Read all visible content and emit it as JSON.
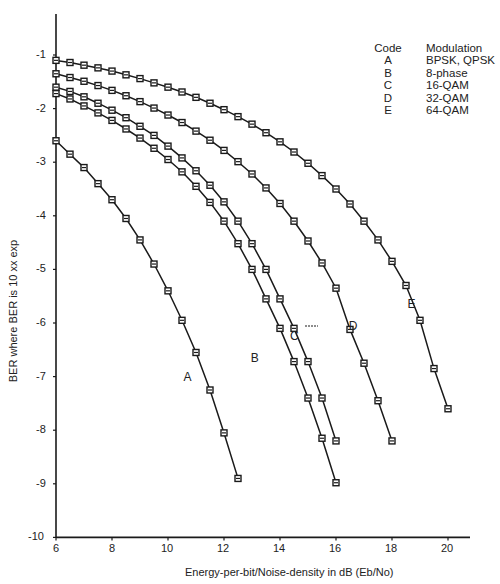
{
  "chart_data": {
    "type": "line",
    "title": "",
    "xlabel": "Energy-per-bit/Noise-density in dB  (Eb/No)",
    "ylabel": "BER where BER is 10 xx exp",
    "xlim": [
      6,
      20.8
    ],
    "ylim": [
      -10,
      -0.4
    ],
    "xticks": [
      6,
      8,
      10,
      12,
      14,
      16,
      18,
      20
    ],
    "yticks": [
      -1,
      -2,
      -3,
      -4,
      -5,
      -6,
      -7,
      -8,
      -9,
      -10
    ],
    "grid": false,
    "legend_position": "top-right",
    "legend": {
      "header": [
        "Code",
        "Modulation"
      ],
      "entries": [
        {
          "code": "A",
          "modulation": "BPSK, QPSK"
        },
        {
          "code": "B",
          "modulation": "8-phase"
        },
        {
          "code": "C",
          "modulation": "16-QAM"
        },
        {
          "code": "D",
          "modulation": "32-QAM"
        },
        {
          "code": "E",
          "modulation": "64-QAM"
        }
      ]
    },
    "series": [
      {
        "name": "A",
        "label": "BPSK, QPSK",
        "x": [
          6,
          6.5,
          7,
          7.5,
          8,
          8.5,
          9,
          9.5,
          10,
          10.5,
          11,
          11.5,
          12,
          12.5
        ],
        "y": [
          -2.6,
          -2.85,
          -3.1,
          -3.4,
          -3.7,
          -4.05,
          -4.45,
          -4.9,
          -5.4,
          -5.95,
          -6.55,
          -7.25,
          -8.05,
          -8.9
        ]
      },
      {
        "name": "B",
        "label": "8-phase",
        "x": [
          6,
          6.5,
          7,
          7.5,
          8,
          8.5,
          9,
          9.5,
          10,
          10.5,
          11,
          11.5,
          12,
          12.5,
          13,
          13.5,
          14,
          14.5,
          15,
          15.5,
          16
        ],
        "y": [
          -1.72,
          -1.82,
          -1.95,
          -2.08,
          -2.22,
          -2.38,
          -2.55,
          -2.74,
          -2.95,
          -3.18,
          -3.45,
          -3.75,
          -4.1,
          -4.52,
          -5.0,
          -5.55,
          -6.1,
          -6.72,
          -7.4,
          -8.15,
          -8.98
        ]
      },
      {
        "name": "C",
        "label": "16-QAM",
        "x": [
          6,
          6.5,
          7,
          7.5,
          8,
          8.5,
          9,
          9.5,
          10,
          10.5,
          11,
          11.5,
          12,
          12.5,
          13,
          13.5,
          14,
          14.5,
          15,
          15.5,
          16
        ],
        "y": [
          -1.6,
          -1.68,
          -1.78,
          -1.9,
          -2.03,
          -2.17,
          -2.33,
          -2.5,
          -2.7,
          -2.92,
          -3.16,
          -3.43,
          -3.74,
          -4.1,
          -4.52,
          -5.0,
          -5.55,
          -6.1,
          -6.72,
          -7.4,
          -8.2
        ]
      },
      {
        "name": "D",
        "label": "32-QAM",
        "x": [
          6,
          6.5,
          7,
          7.5,
          8,
          8.5,
          9,
          9.5,
          10,
          10.5,
          11,
          11.5,
          12,
          12.5,
          13,
          13.5,
          14,
          14.5,
          15,
          15.5,
          16,
          16.5,
          17,
          17.5,
          18
        ],
        "y": [
          -1.35,
          -1.42,
          -1.49,
          -1.57,
          -1.66,
          -1.76,
          -1.87,
          -1.99,
          -2.12,
          -2.26,
          -2.42,
          -2.59,
          -2.78,
          -2.99,
          -3.22,
          -3.48,
          -3.77,
          -4.1,
          -4.47,
          -4.88,
          -5.35,
          -6.12,
          -6.75,
          -7.45,
          -8.2
        ]
      },
      {
        "name": "E",
        "label": "64-QAM",
        "x": [
          6,
          6.5,
          7,
          7.5,
          8,
          8.5,
          9,
          9.5,
          10,
          10.5,
          11,
          11.5,
          12,
          12.5,
          13,
          13.5,
          14,
          14.5,
          15,
          15.5,
          16,
          16.5,
          17,
          17.5,
          18,
          18.5,
          19,
          19.5,
          20
        ],
        "y": [
          -1.1,
          -1.14,
          -1.19,
          -1.24,
          -1.3,
          -1.37,
          -1.44,
          -1.52,
          -1.6,
          -1.69,
          -1.79,
          -1.9,
          -2.02,
          -2.15,
          -2.29,
          -2.45,
          -2.62,
          -2.81,
          -3.02,
          -3.25,
          -3.5,
          -3.78,
          -4.1,
          -4.45,
          -4.85,
          -5.3,
          -5.95,
          -6.85,
          -7.6
        ]
      }
    ],
    "annotations": [
      {
        "text": "A",
        "x": 10.7,
        "y": -7.0
      },
      {
        "text": "B",
        "x": 13.1,
        "y": -6.65
      },
      {
        "text": "C",
        "x": 14.5,
        "y": -6.25
      },
      {
        "text": "D",
        "x": 16.6,
        "y": -6.05
      },
      {
        "text": "E",
        "x": 18.7,
        "y": -5.65
      }
    ]
  },
  "legend": {
    "header_code": "Code",
    "header_modulation": "Modulation",
    "rows": [
      {
        "code": "A",
        "modulation": "BPSK, QPSK"
      },
      {
        "code": "B",
        "modulation": "8-phase"
      },
      {
        "code": "C",
        "modulation": "16-QAM"
      },
      {
        "code": "D",
        "modulation": "32-QAM"
      },
      {
        "code": "E",
        "modulation": "64-QAM"
      }
    ]
  },
  "axes": {
    "ylabel": "BER where BER is 10 xx exp",
    "xlabel": "Energy-per-bit/Noise-density in dB  (Eb/No)"
  }
}
